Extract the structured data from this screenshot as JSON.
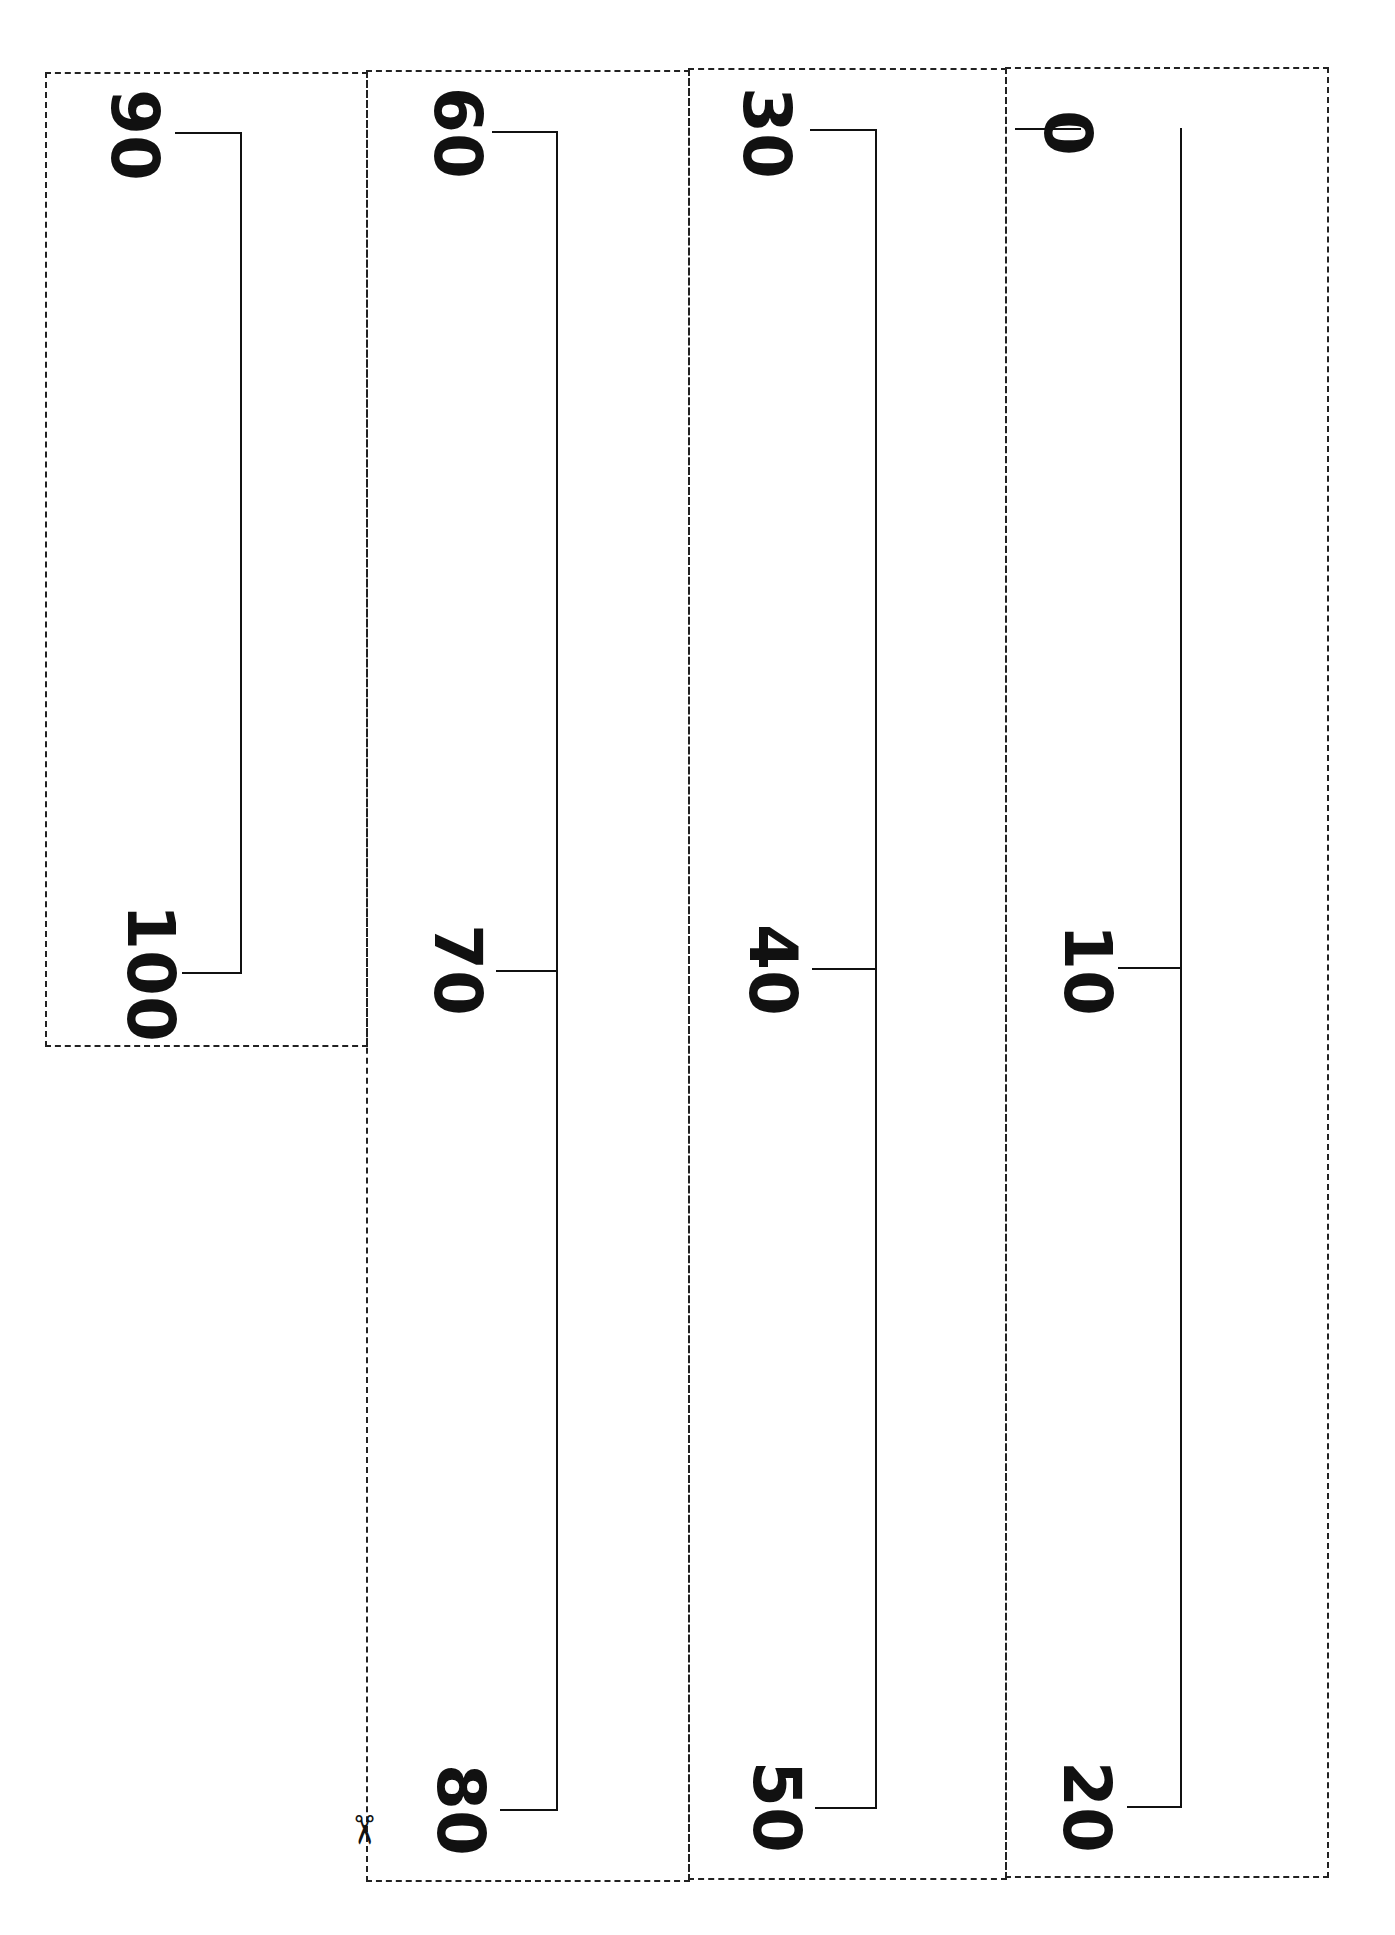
{
  "worksheet": {
    "type": "number line cut-out strips",
    "orientation": "rotated 90 degrees clockwise",
    "strips": [
      {
        "id": "strip-1",
        "labels": [
          "0",
          "10",
          "20"
        ]
      },
      {
        "id": "strip-2",
        "labels": [
          "30",
          "40",
          "50"
        ]
      },
      {
        "id": "strip-3",
        "labels": [
          "60",
          "70",
          "80"
        ]
      },
      {
        "id": "strip-4",
        "labels": [
          "90",
          "100"
        ]
      }
    ],
    "cut_marker": "✂",
    "colors": {
      "line": "#111111",
      "dashed_border": "#222222",
      "background": "#ffffff"
    }
  }
}
